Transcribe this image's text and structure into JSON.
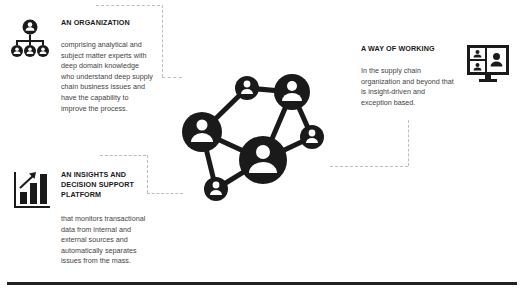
{
  "blocks": [
    {
      "id": "organization",
      "icon": "org-chart-icon",
      "title": "AN ORGANIZATION",
      "body": "comprising analytical and subject matter experts with deep domain knowledge who understand deep supply chain business issues and have the capability to improve the process."
    },
    {
      "id": "platform",
      "icon": "bar-chart-growth-icon",
      "title": "AN INSIGHTS AND DECISION SUPPORT PLATFORM",
      "body": "that monitors transactional data from internal and external sources and automatically separates issues from the mass."
    },
    {
      "id": "way-of-working",
      "icon": "video-conference-monitor-icon",
      "title": "A WAY OF WORKING",
      "body": "In the supply chain organization and beyond that is insight-driven and exception based."
    }
  ],
  "center": {
    "icon": "people-network-icon"
  },
  "colors": {
    "icon": "#1a1a1a",
    "text": "#444444",
    "dashed": "#bdbdbd",
    "rule": "#222222"
  }
}
